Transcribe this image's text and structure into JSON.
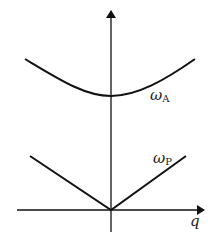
{
  "diagram": {
    "title": "",
    "axes": {
      "x_label": "q",
      "y_label": ""
    },
    "curves": [
      {
        "name": "omega-A",
        "label_main": "ω",
        "label_sub": "A",
        "shape": "parabola-like, minimum at q=0, offset above origin"
      },
      {
        "name": "omega-P",
        "label_main": "ω",
        "label_sub": "P",
        "shape": "V-shaped linear, zero at q=0"
      }
    ],
    "colors": {
      "line": "#111111",
      "background": "#ffffff"
    }
  }
}
